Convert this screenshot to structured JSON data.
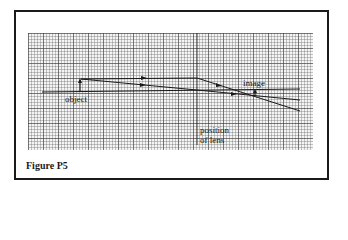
{
  "figure": {
    "caption": "Figure P5",
    "labels": {
      "object": "object",
      "image": "image",
      "lens_line1": "position",
      "lens_line2": "of lens"
    },
    "colors": {
      "line": "#1a1a1a",
      "grid_background": "#f4f4f4",
      "frame": "#1a1a1a"
    },
    "elements": {
      "optical_axis": {
        "x1": 42,
        "y1": 92,
        "x2": 300,
        "y2": 89
      },
      "lens_position_line": {
        "x": 197,
        "y1": 33,
        "y2": 145
      },
      "object_arrow": {
        "x": 80,
        "y_base": 92,
        "y_tip": 79,
        "direction": "up"
      },
      "image_arrow": {
        "x": 255,
        "y_base": 96,
        "y_tip": 90,
        "direction": "up"
      },
      "ray_parallel": {
        "points": [
          [
            80,
            79
          ],
          [
            197,
            78
          ],
          [
            300,
            111
          ]
        ]
      },
      "ray_through_center": {
        "points": [
          [
            80,
            79
          ],
          [
            197,
            90
          ],
          [
            300,
            100
          ]
        ]
      }
    }
  }
}
